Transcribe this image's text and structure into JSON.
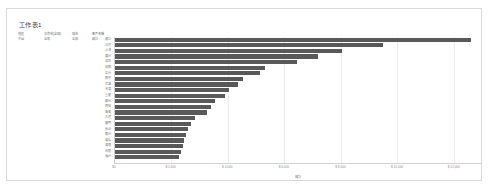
{
  "workbook": {
    "sheet_tab_label": "工作表1"
  },
  "pivot_header": {
    "columns": [
      {
        "label": "地區",
        "value": "中國"
      },
      {
        "label": "北京市(全部)",
        "value": "全部"
      },
      {
        "label": "城市",
        "value": "全部"
      },
      {
        "label": "客戶名稱",
        "value": "總計"
      }
    ]
  },
  "chart_data": {
    "type": "bar",
    "orientation": "horizontal",
    "title": "",
    "xlabel": "總計",
    "ylabel": "",
    "xlim": [
      0,
      13000
    ],
    "grid": true,
    "legend": false,
    "bar_color": "#595959",
    "categories": [
      "總計",
      "北京",
      "上海",
      "廣州",
      "深圳",
      "成都",
      "杭州",
      "南京",
      "武漢",
      "天津",
      "重慶",
      "蘇州",
      "西安",
      "青島",
      "大連",
      "廈門",
      "長沙",
      "鄭州",
      "瀋陽",
      "濟南",
      "合肥",
      "福州"
    ],
    "values": [
      12600,
      9500,
      8050,
      7200,
      6450,
      5300,
      5150,
      4550,
      4350,
      4050,
      3900,
      3550,
      3400,
      3250,
      2850,
      2700,
      2600,
      2500,
      2450,
      2400,
      2350,
      2250
    ],
    "xticks": [
      {
        "value": 0,
        "label": "$0"
      },
      {
        "value": 2000,
        "label": "$ 2,000"
      },
      {
        "value": 4000,
        "label": "$ 4,000"
      },
      {
        "value": 6000,
        "label": "$ 6,000"
      },
      {
        "value": 8000,
        "label": "$ 8,000"
      },
      {
        "value": 10000,
        "label": "$ 10,000"
      },
      {
        "value": 12000,
        "label": "$ 12,000"
      }
    ]
  }
}
